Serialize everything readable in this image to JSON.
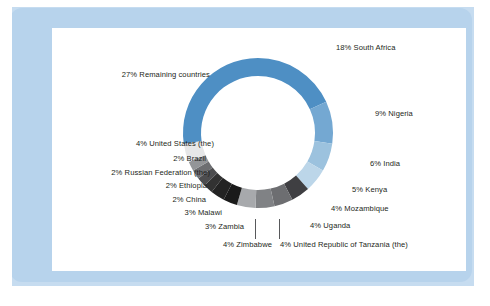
{
  "figure": {
    "background_color": "#b7d3ec",
    "panel_color": "#ffffff",
    "text_color": "#231f20"
  },
  "chart_data": {
    "type": "pie",
    "variant": "donut",
    "title": "",
    "subtitle": "",
    "xlabel": "",
    "ylabel": "",
    "legend_position": "outside-labels",
    "grid": false,
    "units": "percent",
    "start_angle_deg": 0,
    "direction": "clockwise",
    "total": 100,
    "categories": [
      "South Africa",
      "Nigeria",
      "India",
      "Kenya",
      "Mozambique",
      "Uganda",
      "United Republic of Tanzania (the)",
      "Zimbabwe",
      "Zambia",
      "Malawi",
      "China",
      "Ethiopia",
      "Russian Federation (the)",
      "Brazil",
      "United States (the)",
      "Remaining countries"
    ],
    "values": [
      18,
      9,
      6,
      5,
      4,
      4,
      4,
      4,
      3,
      3,
      2,
      2,
      2,
      2,
      4,
      27
    ],
    "colors": [
      "#4e8fc4",
      "#74a8d2",
      "#9cc2de",
      "#bcd6e9",
      "#3f3f42",
      "#6d6e71",
      "#808285",
      "#a7a9ac",
      "#1a1a1a",
      "#232323",
      "#323232",
      "#4d4d4f",
      "#6d6e71",
      "#939598",
      "#e6e7e8",
      "#4e8fc4"
    ],
    "labels": [
      "18% South Africa",
      "9% Nigeria",
      "6% India",
      "5% Kenya",
      "4% Mozambique",
      "4% Uganda",
      "4% United Republic of Tanzania (the)",
      "4% Zimbabwe",
      "3% Zambia",
      "3% Malawi",
      "2% China",
      "2% Ethiopia",
      "2% Russian Federation (the)",
      "2% Brazil",
      "4% United States (the)",
      "27% Remaining countries"
    ]
  },
  "labels": {
    "south_africa": "18% South Africa",
    "nigeria": "9% Nigeria",
    "india": "6% India",
    "kenya": "5% Kenya",
    "mozambique": "4% Mozambique",
    "uganda": "4% Uganda",
    "tanzania": "4% United Republic of Tanzania (the)",
    "zimbabwe": "4% Zimbabwe",
    "zambia": "3% Zambia",
    "malawi": "3% Malawi",
    "china": "2% China",
    "ethiopia": "2% Ethiopia",
    "russian_federation": "2% Russian Federation (the)",
    "brazil": "2% Brazil",
    "united_states": "4% United States (the)",
    "remaining": "27% Remaining countries"
  }
}
